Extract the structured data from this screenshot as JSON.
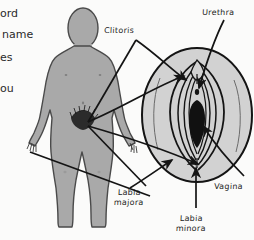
{
  "figure": {
    "title_alt": "Female external genital anatomy diagram",
    "background_color": "#fbfbfa",
    "body_fill": "#a9a9a9",
    "body_stroke": "#4a4a4a",
    "vulva_fill": "#d2d2d2",
    "vulva_stroke": "#1b1b1b",
    "line_color": "#141414",
    "dark_fill": "#111111"
  },
  "cut_text": {
    "line1": "ord",
    "line2": "name",
    "line3": "es",
    "line4": "ou"
  },
  "labels": [
    {
      "id": "clitoris",
      "text": "Clitoris",
      "x": 104,
      "y": 26
    },
    {
      "id": "urethra",
      "text": "Urethra",
      "x": 202,
      "y": 8
    },
    {
      "id": "labia-majora",
      "line1": "Labia",
      "line2": "majora",
      "x": 108,
      "y": 188
    },
    {
      "id": "labia-minora",
      "line1": "Labia",
      "line2": "minora",
      "x": 168,
      "y": 214
    },
    {
      "id": "vagina",
      "text": "Vagina",
      "x": 216,
      "y": 182
    }
  ],
  "colors": {
    "gray_body": "#a9a9a9",
    "gray_vulva": "#d2d2d2",
    "ink": "#141414"
  }
}
